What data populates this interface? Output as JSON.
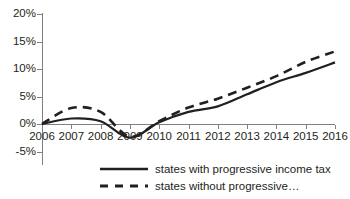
{
  "chart_data": {
    "type": "line",
    "title": "",
    "xlabel": "",
    "ylabel": "",
    "categories": [
      "2006",
      "2007",
      "2008",
      "2009",
      "2010",
      "2011",
      "2012",
      "2013",
      "2014",
      "2015",
      "2016"
    ],
    "ylim": [
      -5,
      20
    ],
    "yticks": [
      20,
      15,
      10,
      5,
      0,
      -5
    ],
    "ytick_labels": [
      "20%",
      "15%",
      "10%",
      "5%",
      "0%",
      "-5%"
    ],
    "grid": false,
    "legend_position": "bottom",
    "series": [
      {
        "name": "states with progressive income tax",
        "style": "solid",
        "color": "#231f20",
        "values": [
          0,
          1.0,
          0.5,
          -2.5,
          0.3,
          2.2,
          3.2,
          5.4,
          7.6,
          9.3,
          11.2
        ]
      },
      {
        "name": "states without progressive...",
        "style": "dashed",
        "color": "#231f20",
        "values": [
          0,
          2.9,
          2.2,
          -2.3,
          0.5,
          3.0,
          4.6,
          6.6,
          8.7,
          11.3,
          13.2
        ]
      }
    ]
  },
  "legend": {
    "items": [
      {
        "label": "states with progressive income tax",
        "style": "solid"
      },
      {
        "label": "states without progressive…",
        "style": "dashed"
      }
    ]
  }
}
